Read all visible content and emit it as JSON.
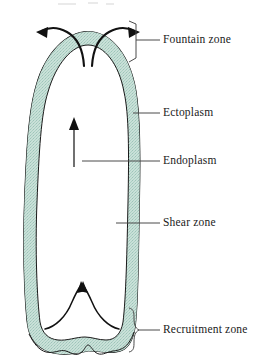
{
  "figure": {
    "background_color": "#ffffff",
    "outline_color": "#1a1a1a",
    "ectoplasm_fill": "#c9e0d8",
    "ectoplasm_stipple": "#8fbcae",
    "endoplasm_fill": "#ffffff",
    "arrow_color": "#111111",
    "leader_color": "#4a4a4a"
  },
  "labels": [
    {
      "id": "fountain-zone",
      "text": "Fountain zone",
      "connector": "bracket",
      "x": 163,
      "y": 33
    },
    {
      "id": "ectoplasm",
      "text": "Ectoplasm",
      "connector": "line",
      "x": 163,
      "y": 108
    },
    {
      "id": "endoplasm",
      "text": "Endoplasm",
      "connector": "line",
      "x": 163,
      "y": 156
    },
    {
      "id": "shear-zone",
      "text": "Shear zone",
      "connector": "line",
      "x": 163,
      "y": 218
    },
    {
      "id": "recruitment-zone",
      "text": "Recruitment zone",
      "connector": "brace",
      "x": 163,
      "y": 325
    }
  ],
  "flow_arrows": [
    {
      "id": "fountain-left-arrow",
      "direction": "outward-down-left",
      "zone": "fountain"
    },
    {
      "id": "fountain-right-arrow",
      "direction": "outward-down-right",
      "zone": "fountain"
    },
    {
      "id": "endoplasm-stream-arrow",
      "direction": "up",
      "zone": "endoplasm"
    },
    {
      "id": "recruitment-left-arrow",
      "direction": "inward-up",
      "zone": "recruitment"
    },
    {
      "id": "recruitment-right-arrow",
      "direction": "inward-up",
      "zone": "recruitment"
    }
  ]
}
